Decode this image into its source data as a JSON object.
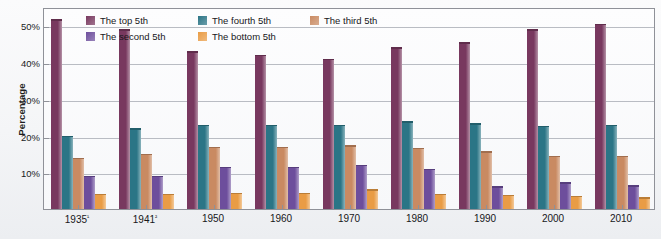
{
  "chart_data": {
    "type": "bar",
    "title": "",
    "subtitle": "",
    "xlabel": "",
    "ylabel": "Percentage",
    "ylim": [
      0,
      55
    ],
    "grid": true,
    "legend_position": "top",
    "categories": [
      "1935¹",
      "1941²",
      "1950",
      "1960",
      "1970",
      "1980",
      "1990",
      "2000",
      "2010"
    ],
    "ytick_labels": [
      "10%",
      "20%",
      "30%",
      "40%",
      "50%"
    ],
    "ytick_values": [
      10,
      20,
      30,
      40,
      50
    ],
    "series": [
      {
        "name": "The top 5th",
        "color": "#78385f",
        "values": [
          51.7,
          49.0,
          43.0,
          42.0,
          40.9,
          44.0,
          45.4,
          49.0,
          50.5
        ]
      },
      {
        "name": "The fourth 5th",
        "color": "#2b7586",
        "values": [
          20.0,
          22.0,
          23.0,
          23.0,
          23.0,
          23.9,
          23.3,
          22.7,
          23.0
        ]
      },
      {
        "name": "The third 5th",
        "color": "#c98a62",
        "values": [
          14.0,
          15.1,
          17.0,
          17.0,
          17.3,
          16.7,
          15.7,
          14.5,
          14.5
        ]
      },
      {
        "name": "The second 5th",
        "color": "#6d4e9c",
        "values": [
          9.0,
          9.1,
          11.5,
          11.5,
          12.0,
          10.9,
          6.2,
          7.3,
          6.5
        ]
      },
      {
        "name": "The bottom 5th",
        "color": "#e99c45",
        "values": [
          4.1,
          4.1,
          4.4,
          4.4,
          5.4,
          4.2,
          3.9,
          3.6,
          3.2
        ]
      }
    ]
  },
  "legend": {
    "items": [
      {
        "label": "The top 5th",
        "swatch_color": "#78385f"
      },
      {
        "label": "The fourth 5th",
        "swatch_color": "#2b7586"
      },
      {
        "label": "The third 5th",
        "swatch_color": "#c98a62"
      },
      {
        "label": "The second 5th",
        "swatch_color": "#6d4e9c"
      },
      {
        "label": "The bottom 5th",
        "swatch_color": "#e99c45"
      }
    ],
    "order": [
      0,
      1,
      2,
      3,
      4
    ]
  }
}
